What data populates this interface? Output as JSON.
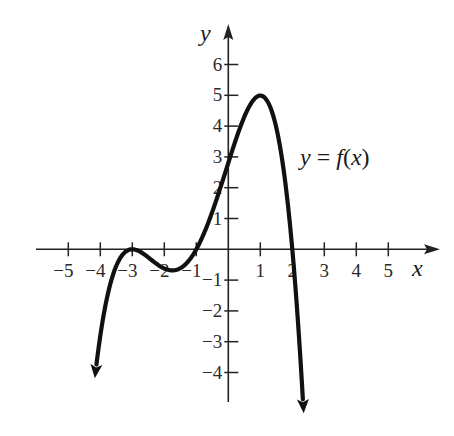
{
  "chart_data": {
    "type": "line",
    "title": "",
    "xlabel": "x",
    "ylabel": "y",
    "curve_label": {
      "prefix": "y",
      "eq": " = ",
      "fname": "f",
      "open": "(",
      "var": "x",
      "close": ")"
    },
    "xlim": [
      -5.5,
      6
    ],
    "ylim": [
      -5.2,
      7
    ],
    "x_ticks": [
      -5,
      -4,
      -3,
      -2,
      -1,
      1,
      2,
      3,
      4,
      5
    ],
    "x_tick_labels": [
      "−5",
      "−4",
      "−3",
      "−2",
      "−1",
      "1",
      "2",
      "3",
      "4",
      "5"
    ],
    "y_ticks": [
      6,
      5,
      4,
      3,
      2,
      1,
      -1,
      -2,
      -3,
      -4
    ],
    "y_tick_labels": [
      "6",
      "5",
      "4",
      "3",
      "2",
      "1",
      "−1",
      "−2",
      "−3",
      "−4"
    ],
    "grid": false,
    "series": [
      {
        "name": "y = f(x)",
        "model": "f(x) = -0.156 (x+3)^2 (x+1)(x-2)",
        "x": [
          -4.16,
          -4.0,
          -3.8,
          -3.5,
          -3.0,
          -2.5,
          -2.0,
          -1.8,
          -1.5,
          -1.0,
          -0.5,
          0.0,
          0.5,
          1.0,
          1.5,
          2.0,
          2.2,
          2.34
        ],
        "y": [
          -4.95,
          -2.81,
          -1.28,
          -0.18,
          0.0,
          -0.17,
          -0.47,
          -0.54,
          -0.49,
          0.0,
          1.07,
          2.81,
          4.6,
          4.99,
          3.47,
          0.0,
          -1.97,
          -3.6
        ]
      }
    ],
    "key_points": {
      "zeros": [
        -3,
        -1,
        2
      ],
      "local_max_touch": {
        "x": -3,
        "y": 0
      },
      "local_min": {
        "x": -1.8,
        "y": -0.7
      },
      "y_intercept": 2.8,
      "global_max": {
        "x": 1,
        "y": 5.3
      }
    },
    "end_behavior": "both ends arrow downward"
  }
}
